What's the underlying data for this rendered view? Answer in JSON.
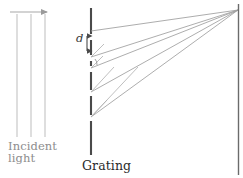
{
  "figure": {
    "type": "optics-ray-diagram",
    "title_visible": false,
    "width": 243,
    "height": 178,
    "background": "#ffffff",
    "labels": {
      "incident_light_line1": "Incident",
      "incident_light_line2": "light",
      "grating": "Grating",
      "slit_spacing": "d"
    },
    "colors": {
      "incident_text": "#8d8d8d",
      "grating_text": "#2b2b2b",
      "d_text": "#3a3a3a",
      "incident_ray": "#b9b9b9",
      "grating_line": "#4a4a4a",
      "diffracted_ray": "#9a9a9a",
      "wavefront": "#b0b0b0",
      "screen_line": "#6b6b6b",
      "arrow": "#9a9a9a"
    },
    "incident_beam": {
      "arrow_label": "propagation-direction",
      "arrow_x_start": 10,
      "arrow_x_end": 49,
      "arrow_y": 12,
      "ray_x_positions": [
        17,
        31,
        45
      ],
      "ray_y_start": 14,
      "ray_y_end": 137
    },
    "grating": {
      "x": 91,
      "y_top": 8,
      "y_bottom": 155,
      "slit_y_positions": [
        31,
        42,
        57,
        68,
        92,
        117
      ],
      "slit_gap": 5
    },
    "diffracted_rays": {
      "count": 5,
      "converge_x": 238,
      "converge_y": 10,
      "origin_y_positions": [
        31,
        57,
        68,
        92,
        117
      ]
    },
    "wavefronts": {
      "count": 4,
      "description": "perpendicular path-difference segments"
    },
    "screen": {
      "x": 238,
      "y_top": 4,
      "y_bottom": 174
    }
  }
}
